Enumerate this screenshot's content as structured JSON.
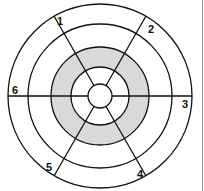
{
  "diagram": {
    "type": "segmented-bullseye",
    "center": [
      100,
      96
    ],
    "rings": [
      {
        "radius": 92,
        "fill": "#ffffff"
      },
      {
        "radius": 72,
        "fill": "#ffffff"
      },
      {
        "radius": 49,
        "fill": "#d9d9d9"
      },
      {
        "radius": 29,
        "fill": "#ffffff"
      },
      {
        "radius": 12,
        "fill": "#ffffff"
      }
    ],
    "shaded_color": "#d9d9d9",
    "stroke_color": "#111111",
    "segment_labels": [
      {
        "id": "1",
        "text": "1"
      },
      {
        "id": "2",
        "text": "2"
      },
      {
        "id": "3",
        "text": "3"
      },
      {
        "id": "4",
        "text": "4"
      },
      {
        "id": "5",
        "text": "5"
      },
      {
        "id": "6",
        "text": "6"
      }
    ]
  }
}
